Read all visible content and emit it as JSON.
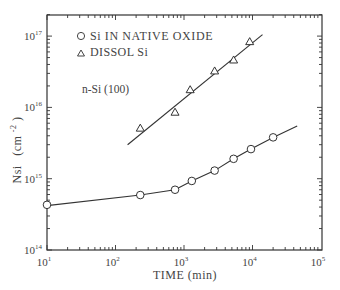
{
  "chart_data": {
    "type": "scatter",
    "title": "",
    "xlabel": "TIME (min)",
    "ylabel": "NSi (cm^-2)",
    "ylabel_main": "Nsi",
    "ylabel_unit": "(cm",
    "ylabel_exp": "-2",
    "ylabel_close": ")",
    "xscale": "log",
    "yscale": "log",
    "xlim": [
      10,
      100000
    ],
    "ylim": [
      100000000000000.0,
      2e+17
    ],
    "x_ticks": [
      {
        "value": 10,
        "base": "10",
        "exp": "1"
      },
      {
        "value": 100,
        "base": "10",
        "exp": "2"
      },
      {
        "value": 1000,
        "base": "10",
        "exp": "3"
      },
      {
        "value": 10000,
        "base": "10",
        "exp": "4"
      },
      {
        "value": 100000,
        "base": "10",
        "exp": "5"
      }
    ],
    "y_ticks": [
      {
        "value": 100000000000000.0,
        "base": "10",
        "exp": "14"
      },
      {
        "value": 1000000000000000.0,
        "base": "10",
        "exp": "15"
      },
      {
        "value": 1e+16,
        "base": "10",
        "exp": "16"
      },
      {
        "value": 1e+17,
        "base": "10",
        "exp": "17"
      }
    ],
    "annotation": "n-Si (100)",
    "grid": false,
    "legend_position": "upper-left",
    "series": [
      {
        "name": "Si IN NATIVE OXIDE",
        "marker": "circle",
        "x": [
          10,
          230,
          740,
          1300,
          2800,
          5300,
          9500,
          20000
        ],
        "y": [
          430000000000000.0,
          590000000000000.0,
          700000000000000.0,
          930000000000000.0,
          1300000000000000.0,
          1900000000000000.0,
          2600000000000000.0,
          3800000000000000.0
        ],
        "fit_line": {
          "x": [
            10,
            230,
            740,
            1300,
            2800,
            5300,
            9500,
            20000,
            45000
          ],
          "y": [
            420000000000000.0,
            590000000000000.0,
            700000000000000.0,
            930000000000000.0,
            1300000000000000.0,
            1900000000000000.0,
            2600000000000000.0,
            3800000000000000.0,
            5500000000000000.0
          ]
        }
      },
      {
        "name": "DISSOL Si",
        "marker": "triangle",
        "x": [
          230,
          740,
          1230,
          2800,
          5300,
          9100
        ],
        "y": [
          5200000000000000.0,
          8700000000000000.0,
          1.8e+16,
          3.3e+16,
          4.7e+16,
          8.5e+16
        ],
        "fit_line": {
          "x": [
            150,
            14000
          ],
          "y": [
            3000000000000000.0,
            1.05e+17
          ]
        }
      }
    ]
  }
}
